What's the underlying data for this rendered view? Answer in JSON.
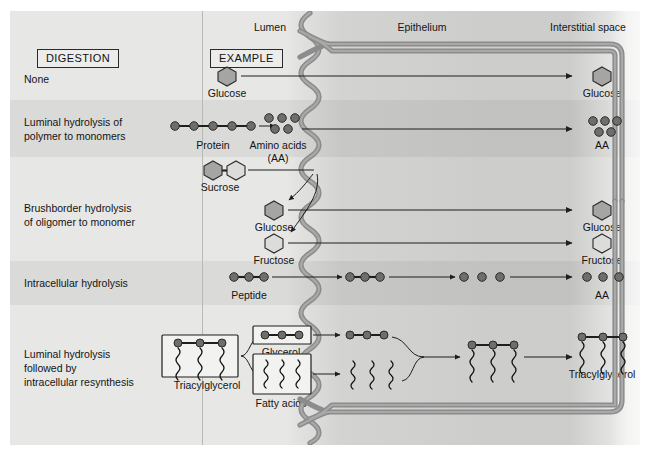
{
  "figure": {
    "type": "diagram",
    "accent_membrane_color": "#8c8c8c",
    "molecule_fill_dark": "#a5a5a3",
    "molecule_fill_light": "#dcdcda",
    "band_shade": "rgba(0,0,0,0.055)"
  },
  "headers": {
    "digestion": "DIGESTION",
    "example": "EXAMPLE"
  },
  "compartments": {
    "lumen": "Lumen",
    "epithelium": "Epithelium",
    "interstitial": "Interstitial space"
  },
  "rows": [
    {
      "id": "none",
      "digestion": [
        "None"
      ],
      "shaded": false,
      "lumen_labels": [
        "Glucose"
      ],
      "interstitial_labels": [
        "Glucose"
      ]
    },
    {
      "id": "luminal-hydrolysis",
      "digestion": [
        "Luminal hydrolysis of",
        "polymer to monomers"
      ],
      "shaded": true,
      "lumen_labels": [
        "Protein",
        "Amino acids",
        "(AA)"
      ],
      "interstitial_labels": [
        "AA"
      ]
    },
    {
      "id": "brushborder-hydrolysis",
      "digestion": [
        "Brushborder hydrolysis",
        "of oligomer to monomer"
      ],
      "shaded": false,
      "lumen_labels": [
        "Sucrose",
        "Glucose",
        "Fructose"
      ],
      "interstitial_labels": [
        "Glucose",
        "Fructose"
      ]
    },
    {
      "id": "intracellular-hydrolysis",
      "digestion": [
        "Intracellular hydrolysis"
      ],
      "shaded": true,
      "lumen_labels": [
        "Peptide"
      ],
      "interstitial_labels": [
        "AA"
      ]
    },
    {
      "id": "luminal-then-resynthesis",
      "digestion": [
        "Luminal hydrolysis",
        "followed by",
        "intracellular resynthesis"
      ],
      "shaded": false,
      "lumen_labels": [
        "Triacylglycerol",
        "Glycerol",
        "Fatty acids"
      ],
      "interstitial_labels": [
        "Triacylglycerol"
      ]
    }
  ],
  "labels": {
    "glucose_none_lumen": "Glucose",
    "glucose_none_interstitial": "Glucose",
    "protein": "Protein",
    "amino_acids_line1": "Amino acids",
    "amino_acids_line2": "(AA)",
    "aa_interstitial_row2": "AA",
    "sucrose": "Sucrose",
    "glucose_bb_lumen": "Glucose",
    "fructose_bb_lumen": "Fructose",
    "glucose_bb_interstitial": "Glucose",
    "fructose_bb_interstitial": "Fructose",
    "peptide": "Peptide",
    "aa_interstitial_row4": "AA",
    "triacylglycerol_lumen": "Triacylglycerol",
    "glycerol": "Glycerol",
    "fatty_acids": "Fatty acids",
    "triacylglycerol_interstitial": "Triacylglycerol",
    "digestion_none": "None",
    "digestion_luminal_l1": "Luminal hydrolysis of",
    "digestion_luminal_l2": "polymer to monomers",
    "digestion_bb_l1": "Brushborder hydrolysis",
    "digestion_bb_l2": "of oligomer to monomer",
    "digestion_intracellular": "Intracellular hydrolysis",
    "digestion_resyn_l1": "Luminal hydrolysis",
    "digestion_resyn_l2": "followed by",
    "digestion_resyn_l3": "intracellular resynthesis"
  }
}
